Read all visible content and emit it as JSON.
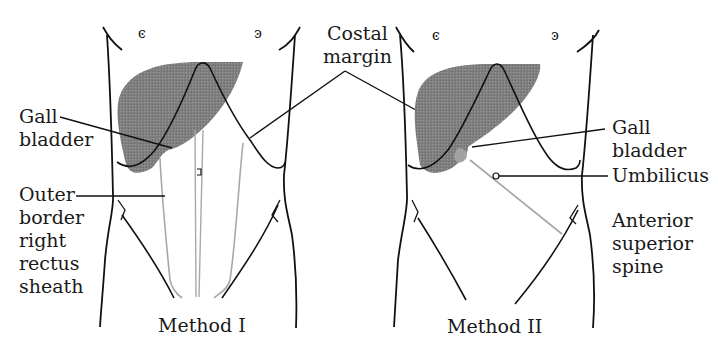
{
  "figure": {
    "panels": [
      {
        "caption": "Method I"
      },
      {
        "caption": "Method II"
      }
    ],
    "labels": {
      "costal_margin": [
        "Costal",
        "margin"
      ],
      "gall_bladder_left": [
        "Gall",
        "bladder"
      ],
      "outer_border": [
        "Outer",
        "border",
        "right",
        "rectus",
        "sheath"
      ],
      "gall_bladder_right": [
        "Gall",
        "bladder"
      ],
      "umbilicus": "Umbilicus",
      "anterior_superior_spine": [
        "Anterior",
        "superior",
        "spine"
      ]
    },
    "colors": {
      "liver": "#7f7f7f",
      "outline": "#111111",
      "guide_line": "#a8a8a8",
      "background": "#ffffff"
    }
  }
}
